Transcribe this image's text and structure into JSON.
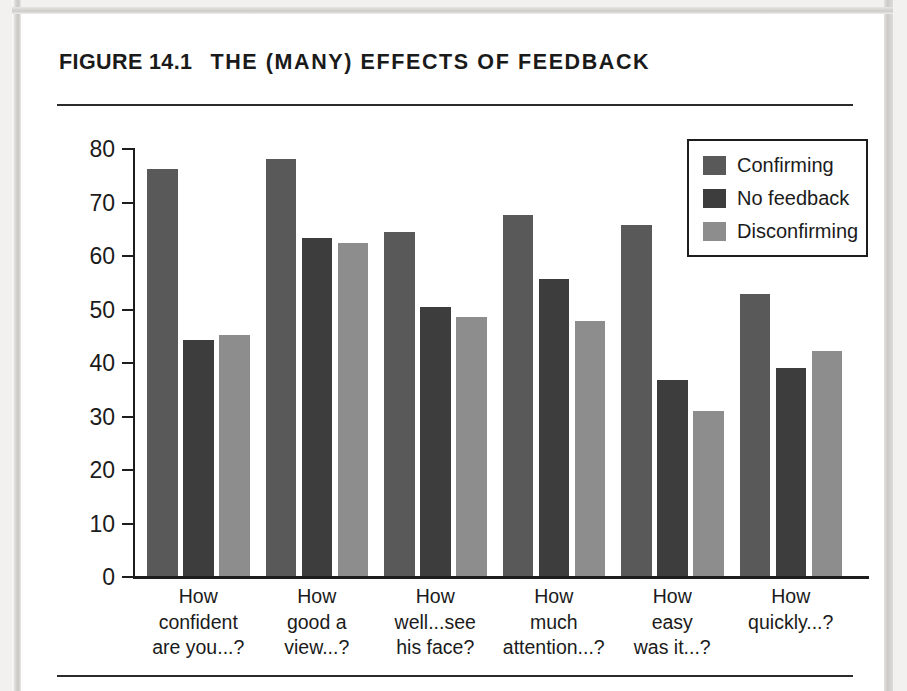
{
  "figure": {
    "label": "FIGURE 14.1",
    "title": "THE (MANY) EFFECTS OF FEEDBACK"
  },
  "colors": {
    "series1": "#595959",
    "series2": "#3d3d3d",
    "series3": "#8d8d8d",
    "axis": "#1d1d1d",
    "text": "#1b1b1b",
    "page_frame": "#cccbc8",
    "sheet": "#ffffff"
  },
  "chart_data": {
    "type": "bar",
    "title": "THE (MANY) EFFECTS OF FEEDBACK",
    "xlabel": "",
    "ylabel": "",
    "ylim": [
      0,
      80
    ],
    "yticks": [
      0,
      10,
      20,
      30,
      40,
      50,
      60,
      70,
      80
    ],
    "grid": false,
    "legend_position": "top-right",
    "categories": [
      "How confident are you...?",
      "How good a view...?",
      "How well...see his face?",
      "How much attention...?",
      "How easy was it...?",
      "How quickly...?"
    ],
    "category_lines": [
      [
        "How",
        "confident",
        "are you...?"
      ],
      [
        "How",
        "good a",
        "view...?"
      ],
      [
        "How",
        "well...see",
        "his face?"
      ],
      [
        "How",
        "much",
        "attention...?"
      ],
      [
        "How",
        "easy",
        "was it...?"
      ],
      [
        "How",
        "quickly...?",
        ""
      ]
    ],
    "series": [
      {
        "name": "Confirming",
        "color": "#595959",
        "values": [
          76.0,
          78.0,
          64.3,
          67.4,
          65.6,
          52.8
        ]
      },
      {
        "name": "No feedback",
        "color": "#3d3d3d",
        "values": [
          44.1,
          63.1,
          50.3,
          55.5,
          36.7,
          38.8
        ]
      },
      {
        "name": "Disconfirming",
        "color": "#8d8d8d",
        "values": [
          45.1,
          62.2,
          48.4,
          47.6,
          30.8,
          42.0
        ]
      }
    ]
  }
}
